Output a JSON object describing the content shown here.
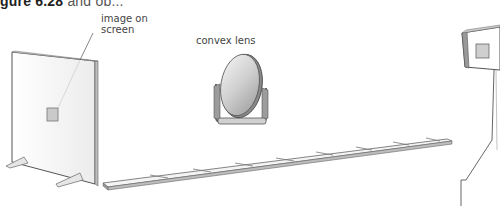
{
  "title": {
    "bold": "gure 6.28",
    "rest": "and ob..."
  },
  "labels": {
    "image_on_screen_line1": "image on",
    "image_on_screen_line2": "screen",
    "convex_lens": "convex lens"
  },
  "colors": {
    "outline": "#555555",
    "panel": "#ffffff",
    "shade": "#d8d8d8",
    "image_patch": "#c8c8c8"
  }
}
